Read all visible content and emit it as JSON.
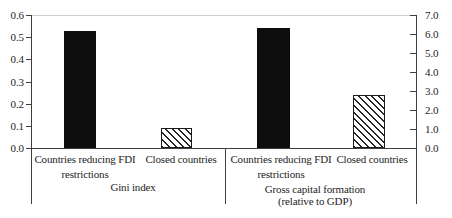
{
  "figure": {
    "background": "#ffffff",
    "bar_color": "#0e0e0e",
    "axis_color": "#3f3f3f"
  },
  "chart_data": [
    {
      "type": "bar",
      "panel": "left",
      "title": "Gini index",
      "categories": [
        "Countries reducing FDI restrictions",
        "Closed countries"
      ],
      "category_lines": [
        [
          "Countries reducing FDI",
          "restrictions"
        ],
        [
          "Closed countries"
        ]
      ],
      "values": [
        0.53,
        0.09
      ],
      "bar_styles": [
        "solid",
        "hatched"
      ],
      "ylim": [
        0,
        0.6
      ],
      "yticks": [
        "0.0",
        "0.1",
        "0.2",
        "0.3",
        "0.4",
        "0.5",
        "0.6"
      ],
      "axis_side": "left",
      "grid": false,
      "legend": "none"
    },
    {
      "type": "bar",
      "panel": "right",
      "title": "Gross capital formation (relative to GDP)",
      "title_lines": [
        "Gross capital formation",
        "(relative to GDP)"
      ],
      "categories": [
        "Countries reducing FDI restrictions",
        "Closed countries"
      ],
      "category_lines": [
        [
          "Countries reducing FDI",
          "restrictions"
        ],
        [
          "Closed countries"
        ]
      ],
      "values": [
        6.3,
        2.8
      ],
      "bar_styles": [
        "solid",
        "hatched"
      ],
      "ylim": [
        0,
        7.0
      ],
      "yticks": [
        "0.0",
        "1.0",
        "2.0",
        "3.0",
        "4.0",
        "5.0",
        "6.0",
        "7.0"
      ],
      "axis_side": "right",
      "grid": false,
      "legend": "none"
    }
  ]
}
